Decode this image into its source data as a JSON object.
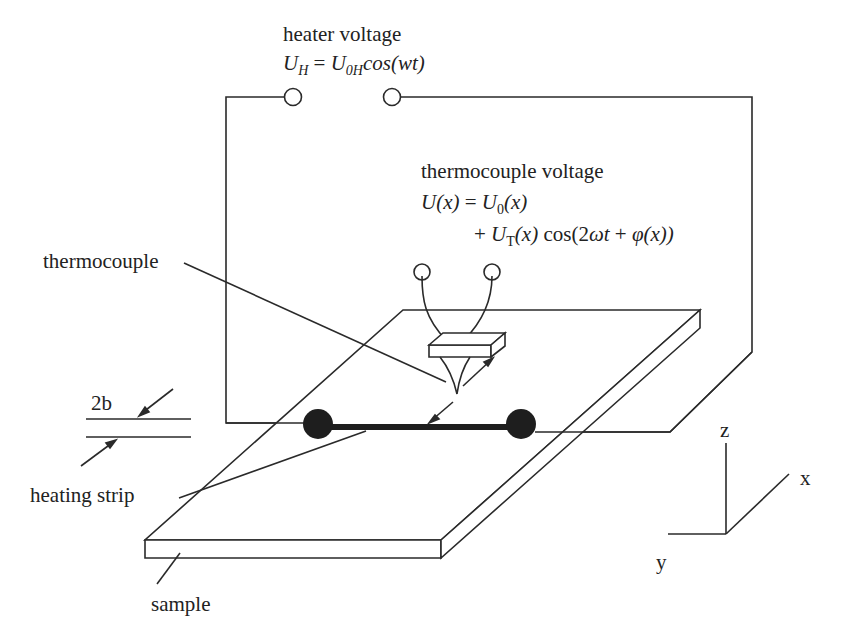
{
  "colors": {
    "line": "#2a2a2a",
    "dot": "#1e1e1e",
    "background": "#ffffff"
  },
  "labels": {
    "heater_voltage": "heater voltage",
    "heater_eq": {
      "lhs": "U",
      "lhs_sub": "H",
      "eq": " = ",
      "u": "U",
      "u_sub": "0H",
      "rest": "cos(wt)"
    },
    "thermocouple_voltage": "thermocouple voltage",
    "tc_eq_line1": {
      "u": "U",
      "x": "(x)",
      "eq": " = ",
      "u0": "U",
      "u0_sub": "0",
      "x2": "(x)"
    },
    "tc_eq_line2": {
      "plus": "+ ",
      "ut": "U",
      "ut_sub": "T",
      "x": "(x)",
      "cos": " cos(2",
      "omega": "ωt",
      "plus2": " + ",
      "phi": "φ",
      "x3": "(x))"
    },
    "thermocouple": "thermocouple",
    "width_2b": "2b",
    "heating_strip": "heating strip",
    "sample": "sample",
    "axis_z": "z",
    "axis_x": "x",
    "axis_y": "y"
  },
  "equations_plain": {
    "heater": "U_H = U_0H cos(wt)",
    "thermocouple": "U(x) = U_0(x) + U_T(x) cos(2ωt + φ(x))"
  },
  "components": [
    "heater-terminals",
    "heater-circuit-wire",
    "thermocouple-probe",
    "thermocouple-terminals",
    "heating-strip",
    "strip-contacts",
    "sample-slab",
    "coordinate-axes"
  ]
}
